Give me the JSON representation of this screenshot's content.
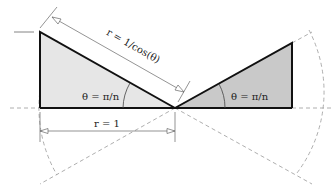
{
  "diagram": {
    "labels": {
      "hypotenuse": "r = 1/cos(θ)",
      "base": "r = 1",
      "angle_left": "θ = π/n",
      "angle_right": "θ = π/n"
    },
    "colors": {
      "left_fill": "#e6e6e6",
      "right_fill": "#c9c9c9",
      "stroke": "#111111",
      "dashed": "#888888",
      "dimension": "#666666"
    }
  }
}
